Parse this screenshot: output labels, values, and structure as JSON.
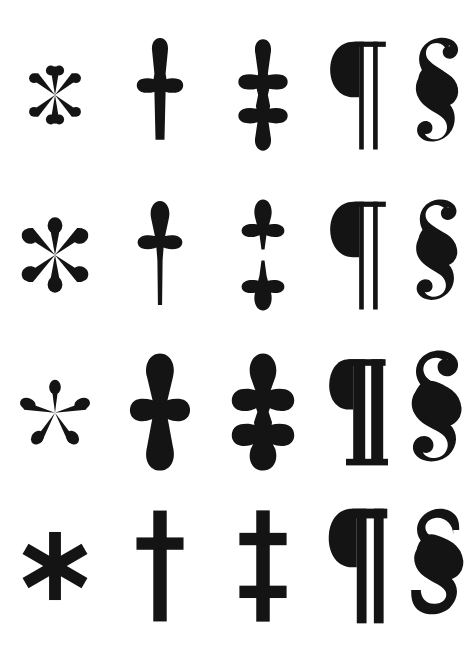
{
  "sheet": {
    "title": "Typographic Reference Marks Specimen",
    "background_color": "#ffffff",
    "ink_color": "#141414",
    "width": 473,
    "height": 660,
    "columns": 5,
    "rows": 4
  },
  "marks": [
    {
      "key": "asterisk",
      "label": "Asterisk",
      "character": "*"
    },
    {
      "key": "dagger",
      "label": "Dagger",
      "character": "†"
    },
    {
      "key": "double-dagger",
      "label": "Double Dagger",
      "character": "‡"
    },
    {
      "key": "pilcrow",
      "label": "Pilcrow",
      "character": "¶"
    },
    {
      "key": "section-sign",
      "label": "Section Sign",
      "character": "§"
    }
  ],
  "rows": [
    {
      "key": "row-old-style",
      "style_label": "Old Style Serif",
      "cells": [
        {
          "mark": "Asterisk",
          "character": "*",
          "variant": "six-petal teardrop"
        },
        {
          "mark": "Dagger",
          "character": "†",
          "variant": "tapered blade, teardrop terminals"
        },
        {
          "mark": "Double Dagger",
          "character": "‡",
          "variant": "joined stem, teardrop terminals"
        },
        {
          "mark": "Pilcrow",
          "character": "¶",
          "variant": "solid bowl, two hairline stems"
        },
        {
          "mark": "Section Sign",
          "character": "§",
          "variant": "calligraphic, curl terminals"
        }
      ]
    },
    {
      "key": "row-transitional",
      "style_label": "Transitional Serif",
      "cells": [
        {
          "mark": "Asterisk",
          "character": "*",
          "variant": "six-petal teardrop, wide"
        },
        {
          "mark": "Dagger",
          "character": "†",
          "variant": "long hairline stem, teardrop arms"
        },
        {
          "mark": "Double Dagger",
          "character": "‡",
          "variant": "split into two crosses"
        },
        {
          "mark": "Pilcrow",
          "character": "¶",
          "variant": "solid bowl, two hairline stems"
        },
        {
          "mark": "Section Sign",
          "character": "§",
          "variant": "high contrast, thin curls"
        }
      ]
    },
    {
      "key": "row-bold-serif",
      "style_label": "Bold Serif",
      "cells": [
        {
          "mark": "Asterisk",
          "character": "*",
          "variant": "five-petal teardrop"
        },
        {
          "mark": "Dagger",
          "character": "†",
          "variant": "heavy rounded teardrops"
        },
        {
          "mark": "Double Dagger",
          "character": "‡",
          "variant": "heavy joined stem"
        },
        {
          "mark": "Pilcrow",
          "character": "¶",
          "variant": "slab serif feet, thick stems"
        },
        {
          "mark": "Section Sign",
          "character": "§",
          "variant": "bold, ball terminals"
        }
      ]
    },
    {
      "key": "row-sans-serif",
      "style_label": "Sans Serif",
      "cells": [
        {
          "mark": "Asterisk",
          "character": "*",
          "variant": "six straight spokes"
        },
        {
          "mark": "Dagger",
          "character": "†",
          "variant": "flat rectangular bars"
        },
        {
          "mark": "Double Dagger",
          "character": "‡",
          "variant": "flat rectangular bars, two crossbars"
        },
        {
          "mark": "Pilcrow",
          "character": "¶",
          "variant": "geometric bowl, flat top bar"
        },
        {
          "mark": "Section Sign",
          "character": "§",
          "variant": "geometric, flat terminals"
        }
      ]
    }
  ]
}
